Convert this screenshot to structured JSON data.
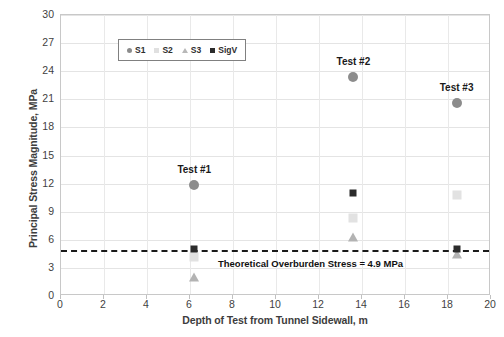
{
  "chart_data": {
    "type": "scatter",
    "title": "",
    "xlabel": "Depth of Test from Tunnel Sidewall, m",
    "ylabel": "Principal Stress Magnitude, MPa",
    "xlim": [
      0,
      20
    ],
    "ylim": [
      0,
      30
    ],
    "xticks": [
      0,
      2,
      4,
      6,
      8,
      10,
      12,
      14,
      16,
      18,
      20
    ],
    "yticks": [
      0,
      3,
      6,
      9,
      12,
      15,
      18,
      21,
      24,
      27,
      30
    ],
    "grid": true,
    "legend_position": "top-left",
    "series": [
      {
        "name": "S1",
        "marker": "circle",
        "color": "#8c8c8c",
        "points": [
          {
            "x": 6.2,
            "y": 11.9
          },
          {
            "x": 13.6,
            "y": 23.4
          },
          {
            "x": 18.4,
            "y": 20.6
          }
        ]
      },
      {
        "name": "S2",
        "marker": "square",
        "color": "#e2e2e2",
        "points": [
          {
            "x": 6.2,
            "y": 4.2
          },
          {
            "x": 13.6,
            "y": 8.3
          },
          {
            "x": 18.4,
            "y": 10.8
          }
        ]
      },
      {
        "name": "S3",
        "marker": "triangle",
        "color": "#b3b3b3",
        "points": [
          {
            "x": 6.2,
            "y": 2.0
          },
          {
            "x": 13.6,
            "y": 6.3
          },
          {
            "x": 18.4,
            "y": 4.5
          }
        ]
      },
      {
        "name": "SigV",
        "marker": "square-filled",
        "color": "#2b2b2b",
        "points": [
          {
            "x": 6.2,
            "y": 5.0
          },
          {
            "x": 13.6,
            "y": 11.0
          },
          {
            "x": 18.4,
            "y": 5.0
          }
        ]
      }
    ],
    "point_labels": [
      {
        "text": "Test #1",
        "x": 6.2,
        "y": 13.6
      },
      {
        "text": "Test #2",
        "x": 13.6,
        "y": 25.1
      },
      {
        "text": "Test #3",
        "x": 18.4,
        "y": 22.3
      }
    ],
    "annotations": [
      {
        "type": "hline",
        "value": 4.9,
        "style": "dashed",
        "color": "#1a1a1a",
        "label": "Theoretical Overburden Stress = 4.9 MPa",
        "label_x": 7.3,
        "label_y": 3.55
      }
    ]
  },
  "legend": {
    "entries": [
      {
        "label": "S1",
        "marker": "circle-icon"
      },
      {
        "label": "S2",
        "marker": "square-light-icon"
      },
      {
        "label": "S3",
        "marker": "triangle-icon"
      },
      {
        "label": "SigV",
        "marker": "square-dark-icon"
      }
    ]
  }
}
